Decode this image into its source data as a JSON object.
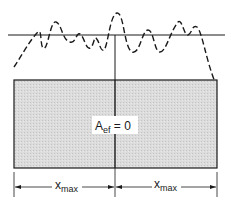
{
  "diagram": {
    "type": "mechanical-sketch",
    "colors": {
      "ink": "#1a1a1a",
      "fill": "#d9d9d9",
      "background": "#ffffff"
    },
    "center_label": {
      "main": "A",
      "subscript": "ef",
      "rest": " = 0"
    },
    "dimensions": [
      {
        "main": "x",
        "subscript": "max",
        "side": "left"
      },
      {
        "main": "x",
        "subscript": "max",
        "side": "right"
      }
    ]
  }
}
